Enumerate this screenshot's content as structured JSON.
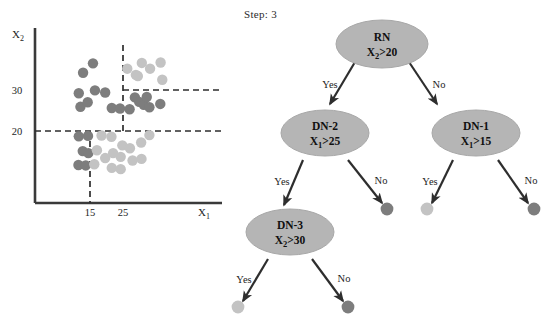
{
  "figure": {
    "step_label": "Step: 3",
    "background": "#ffffff"
  },
  "colors": {
    "class_a_dark": "#7d7d7d",
    "class_b_light": "#c3c3c3",
    "node_fill": "#b5b5b5",
    "node_stroke": "#9a9a9a",
    "axis": "#3a3a3a",
    "edge": "#2e2e2e",
    "dashed": "#2e2e2e",
    "text": "#1d1d1d"
  },
  "scatter": {
    "title": "",
    "xlabel": "X₁",
    "ylabel": "X₂",
    "x_ticks": [
      "15",
      "25"
    ],
    "y_ticks": [
      "20",
      "30"
    ],
    "split_lines": [
      {
        "name": "x2-eq-20",
        "orientation": "horizontal",
        "value": "20"
      },
      {
        "name": "x2-eq-30",
        "orientation": "horizontal",
        "value": "30"
      },
      {
        "name": "x1-eq-15",
        "orientation": "vertical",
        "value": "15"
      },
      {
        "name": "x1-eq-25",
        "orientation": "vertical",
        "value": "25"
      }
    ],
    "legend": []
  },
  "chart_data": {
    "type": "scatter",
    "title": "Step: 3",
    "xlabel": "X₁",
    "ylabel": "X₂",
    "xlim": [
      10,
      40
    ],
    "ylim": [
      10,
      40
    ],
    "x_ticks": [
      15,
      25
    ],
    "y_ticks": [
      20,
      30
    ],
    "grid": false,
    "legend": [],
    "annotations": [
      {
        "type": "vline",
        "x": 15,
        "style": "dashed",
        "label": "X₁>15"
      },
      {
        "type": "vline",
        "x": 25,
        "style": "dashed",
        "label": "X₁>25",
        "ymin": 20
      },
      {
        "type": "hline",
        "y": 20,
        "style": "dashed",
        "label": "X₂>20"
      },
      {
        "type": "hline",
        "y": 30,
        "style": "dashed",
        "label": "X₂>30",
        "xmin": 25
      }
    ],
    "series": [
      {
        "name": "class-dark",
        "color": "#7d7d7d",
        "points": [
          [
            11.6,
            29.2
          ],
          [
            12.1,
            25.9
          ],
          [
            12.9,
            34.2
          ],
          [
            14.3,
            27.0
          ],
          [
            15.9,
            36.5
          ],
          [
            16.5,
            29.9
          ],
          [
            19.6,
            29.4
          ],
          [
            21.6,
            25.6
          ],
          [
            24.1,
            25.5
          ],
          [
            27.0,
            25.3
          ],
          [
            28.6,
            28.2
          ],
          [
            29.9,
            27.1
          ],
          [
            31.3,
            26.4
          ],
          [
            32.2,
            28.3
          ],
          [
            33.0,
            25.8
          ],
          [
            36.3,
            26.6
          ],
          [
            11.6,
            18.7
          ],
          [
            14.4,
            18.8
          ],
          [
            12.8,
            15.1
          ],
          [
            14.5,
            14.6
          ],
          [
            11.5,
            11.7
          ],
          [
            13.7,
            11.6
          ]
        ]
      },
      {
        "name": "class-light",
        "color": "#c3c3c3",
        "points": [
          [
            26.3,
            35.2
          ],
          [
            28.9,
            33.7
          ],
          [
            30.7,
            36.6
          ],
          [
            33.2,
            35.2
          ],
          [
            36.4,
            36.7
          ],
          [
            29.5,
            33.4
          ],
          [
            36.9,
            32.5
          ],
          [
            18.5,
            18.9
          ],
          [
            17.1,
            15.3
          ],
          [
            16.3,
            11.9
          ],
          [
            19.6,
            13.4
          ],
          [
            21.5,
            18.6
          ],
          [
            22.0,
            14.6
          ],
          [
            21.6,
            11.0
          ],
          [
            24.8,
            16.5
          ],
          [
            24.3,
            13.7
          ],
          [
            24.3,
            10.7
          ],
          [
            27.1,
            15.8
          ],
          [
            27.9,
            12.8
          ],
          [
            30.5,
            17.2
          ],
          [
            30.6,
            13.2
          ],
          [
            33.0,
            19.0
          ]
        ]
      }
    ]
  },
  "tree": {
    "nodes": [
      {
        "id": "RN",
        "name": "root-node",
        "label": "RN",
        "condition": "X₂>20",
        "condition_var": "X",
        "condition_sub": "2",
        "condition_op": ">20"
      },
      {
        "id": "DN-2",
        "name": "decision-node-2",
        "label": "DN-2",
        "condition": "X₁>25",
        "condition_var": "X",
        "condition_sub": "1",
        "condition_op": ">25"
      },
      {
        "id": "DN-1",
        "name": "decision-node-1",
        "label": "DN-1",
        "condition": "X₁>15",
        "condition_var": "X",
        "condition_sub": "1",
        "condition_op": ">15"
      },
      {
        "id": "DN-3",
        "name": "decision-node-3",
        "label": "DN-3",
        "condition": "X₂>30",
        "condition_var": "X",
        "condition_sub": "2",
        "condition_op": ">30"
      }
    ],
    "edges": [
      {
        "from": "RN",
        "to": "DN-2",
        "label": "Yes"
      },
      {
        "from": "RN",
        "to": "DN-1",
        "label": "No"
      },
      {
        "from": "DN-2",
        "to": "DN-3",
        "label": "Yes"
      },
      {
        "from": "DN-2",
        "to": "leaf-dn2-no",
        "label": "No"
      },
      {
        "from": "DN-1",
        "to": "leaf-dn1-yes",
        "label": "Yes"
      },
      {
        "from": "DN-1",
        "to": "leaf-dn1-no",
        "label": "No"
      },
      {
        "from": "DN-3",
        "to": "leaf-dn3-yes",
        "label": "Yes"
      },
      {
        "from": "DN-3",
        "to": "leaf-dn3-no",
        "label": "No"
      }
    ],
    "leaves": [
      {
        "id": "leaf-dn2-no",
        "name": "leaf-node-dark",
        "class": "class-dark"
      },
      {
        "id": "leaf-dn1-yes",
        "name": "leaf-node-light",
        "class": "class-light"
      },
      {
        "id": "leaf-dn1-no",
        "name": "leaf-node-dark",
        "class": "class-dark"
      },
      {
        "id": "leaf-dn3-yes",
        "name": "leaf-node-light",
        "class": "class-light"
      },
      {
        "id": "leaf-dn3-no",
        "name": "leaf-node-dark",
        "class": "class-dark"
      }
    ]
  }
}
